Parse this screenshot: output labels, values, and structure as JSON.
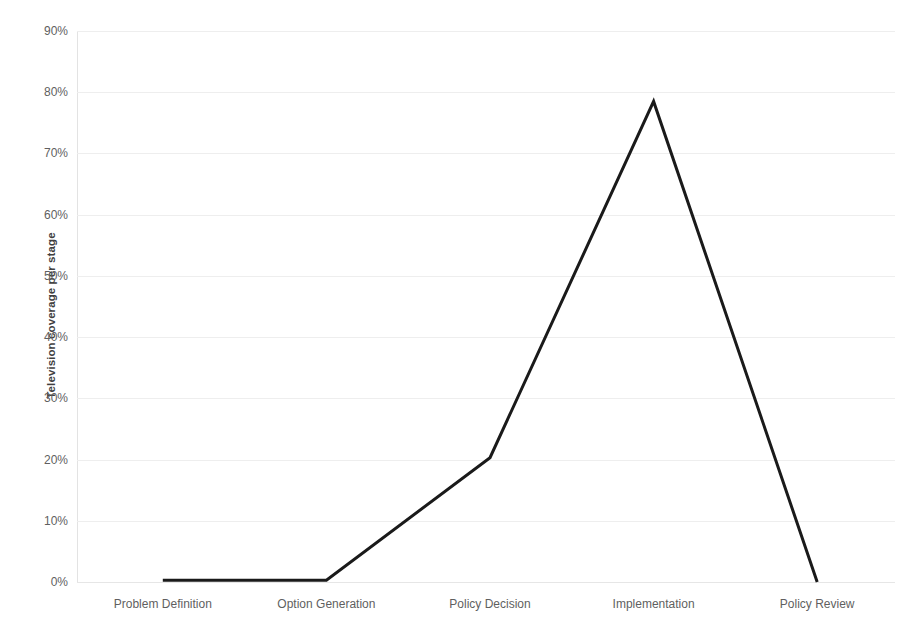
{
  "chart_data": {
    "type": "line",
    "title": "",
    "subtitle": "",
    "xlabel": "",
    "ylabel": "Television coverage per stage",
    "categories": [
      "Problem Definition",
      "Option Generation",
      "Policy Decision",
      "Implementation",
      "Policy Review"
    ],
    "values": [
      0.3,
      0.3,
      20.3,
      78.5,
      0.0
    ],
    "series": [
      {
        "name": "Television coverage per stage",
        "values": [
          0.3,
          0.3,
          20.3,
          78.5,
          0.0
        ]
      }
    ],
    "ylim": [
      0,
      90
    ],
    "ytick_values": [
      0,
      10,
      20,
      30,
      40,
      50,
      60,
      70,
      80,
      90
    ],
    "ytick_labels": [
      "0%",
      "10%",
      "20%",
      "30%",
      "40%",
      "50%",
      "60%",
      "70%",
      "80%",
      "90%"
    ],
    "value_format": "percent",
    "grid": true,
    "grid_axis": "y",
    "legend": false,
    "legend_position": "none",
    "annotations": [],
    "line_color": "#1a1a1a",
    "grid_color": "#eeeeee",
    "tick_label_color": "#5f5f5f",
    "axis_title_color": "#3f3f3f",
    "background_color": "#ffffff"
  }
}
